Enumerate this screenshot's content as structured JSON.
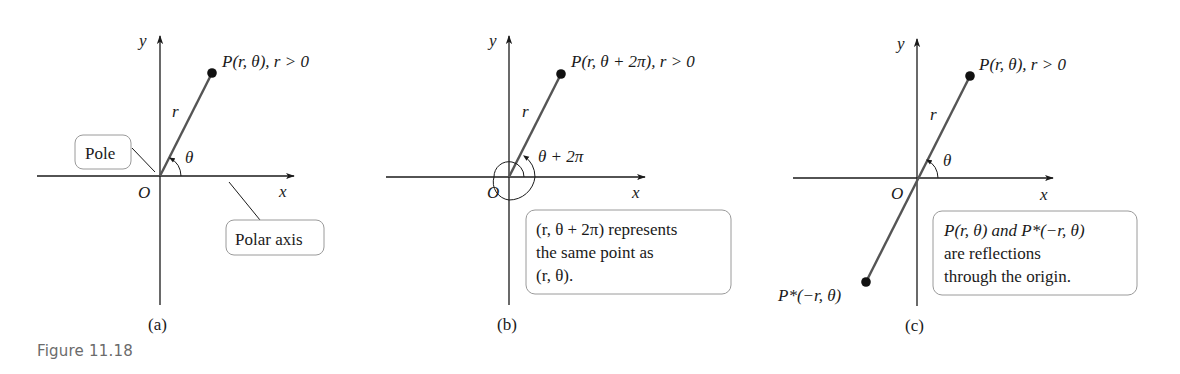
{
  "figure": {
    "caption": "Figure 11.18",
    "colors": {
      "axis": "#1a1a1a",
      "radial_line": "#555555",
      "box_border": "#9a9a9a",
      "caption": "#6b6b6b"
    }
  },
  "panels": [
    {
      "id": "a",
      "sublabel": "(a)",
      "axis_x_label": "x",
      "axis_y_label": "y",
      "origin_label": "O",
      "point_label": "P(r, θ), r > 0",
      "radius_label": "r",
      "angle_label": "θ",
      "callouts": [
        {
          "text": "Pole"
        },
        {
          "text": "Polar axis"
        }
      ]
    },
    {
      "id": "b",
      "sublabel": "(b)",
      "axis_x_label": "x",
      "axis_y_label": "y",
      "origin_label": "O",
      "point_label": "P(r, θ + 2π), r > 0",
      "radius_label": "r",
      "angle_label": "θ + 2π",
      "note_lines": [
        "(r, θ + 2π) represents",
        "the same point as",
        "(r, θ)."
      ]
    },
    {
      "id": "c",
      "sublabel": "(c)",
      "axis_x_label": "x",
      "axis_y_label": "y",
      "origin_label": "O",
      "point_label": "P(r, θ), r > 0",
      "reflected_point_label": "P*(−r, θ)",
      "radius_label": "r",
      "angle_label": "θ",
      "note_lines": [
        "P(r, θ) and P*(−r, θ)",
        "are reflections",
        "through the origin."
      ]
    }
  ]
}
